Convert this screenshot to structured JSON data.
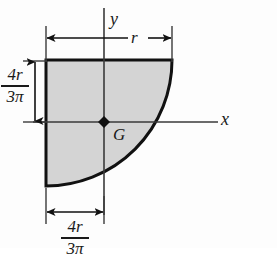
{
  "figure": {
    "shape": {
      "name": "quarter-circle",
      "fill_color": "#d4d4d4",
      "outline_color": "#111111"
    },
    "background_color": "#fdfdfd"
  },
  "axes": {
    "x_label": "x",
    "y_label": "y",
    "line_color": "#3a3a3a"
  },
  "centroid": {
    "label": "G",
    "marker": "diamond-marker",
    "marker_color": "#111111"
  },
  "dimensions": {
    "radius": {
      "label": "r",
      "name": "radius-dimension"
    },
    "vertical_centroid": {
      "numerator": "4r",
      "denominator": "3π",
      "name": "vertical-centroid-dimension"
    },
    "horizontal_centroid": {
      "numerator": "4r",
      "denominator": "3π",
      "name": "horizontal-centroid-dimension"
    }
  }
}
